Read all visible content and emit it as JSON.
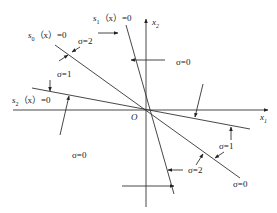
{
  "diagram": {
    "type": "switching-surfaces-phase-plane",
    "axes": {
      "x_label": "x",
      "x_sub": "1",
      "y_label": "x",
      "y_sub": "2",
      "origin_label": "O"
    },
    "surfaces": [
      {
        "id": "s1",
        "name": "s",
        "sub": "1",
        "rest": "（x）=0"
      },
      {
        "id": "s0",
        "name": "s",
        "sub": "0",
        "rest": "（x）=0"
      },
      {
        "id": "s2",
        "name": "s",
        "sub": "2",
        "rest": "（x）=0"
      }
    ],
    "region_labels": [
      {
        "id": "upper-left-sigma2",
        "text": "σ=2"
      },
      {
        "id": "upper-left-sigma1",
        "text": "σ=1"
      },
      {
        "id": "upper-right-sigma0",
        "text": "σ=0"
      },
      {
        "id": "lower-left-sigma0",
        "text": "σ=0"
      },
      {
        "id": "lower-right-sigma1",
        "text": "σ=1"
      },
      {
        "id": "lower-right-sigma2",
        "text": "σ=2"
      },
      {
        "id": "lower-right-sigma0",
        "text": "σ=0"
      }
    ],
    "colors": {
      "line": "#333333",
      "text": "#222222",
      "background": "#ffffff"
    }
  }
}
